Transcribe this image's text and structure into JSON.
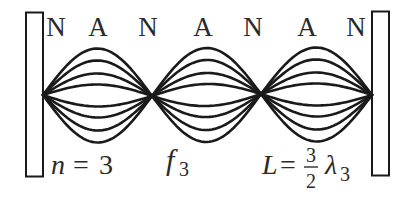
{
  "figure": {
    "colors": {
      "stroke": "#1a1a1a",
      "text": "#2a2a2a",
      "background": "#ffffff"
    },
    "node_labels": [
      "N",
      "A",
      "N",
      "A",
      "N",
      "A",
      "N"
    ],
    "harmonic_label": {
      "var": "n",
      "eq": "=",
      "value": "3"
    },
    "frequency_label": {
      "symbol": "f",
      "subscript": "3"
    },
    "length_label": {
      "var": "L",
      "eq": "=",
      "numerator": "3",
      "denominator": "2",
      "symbol": "λ",
      "subscript": "3"
    },
    "loops": 3,
    "curves_per_side": 4
  }
}
